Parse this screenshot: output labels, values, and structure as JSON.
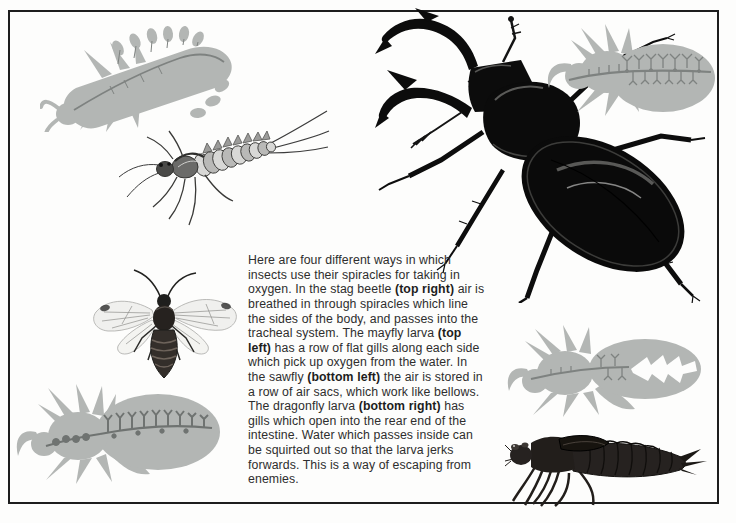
{
  "page": {
    "type": "book-illustration-page",
    "background": "#fdfdfc",
    "frame_color": "#1d1d1d"
  },
  "colors": {
    "silhouette_gray": "#b3b6b4",
    "silhouette_detail": "#7e8280",
    "air_sac_dark": "#6f7371",
    "ink_black": "#0c0c0c",
    "larva_dark_brown": "#262220",
    "text": "#2e2e2e"
  },
  "description": {
    "p1": "Here are four different ways in which insects use their spiracles for taking in oxygen. In the stag beetle ",
    "b1": "(top right)",
    "p2": " air is breathed in through spiracles which line the sides of the body, and passes into the tracheal system. The mayfly larva ",
    "b2": "(top left)",
    "p3": "  has a row of flat gills along each side which pick up oxygen from the water. In the sawfly ",
    "b3": "(bottom left)",
    "p4": " the air is stored in a row of air sacs, which work like bellows. The dragonfly larva ",
    "b4": "(bottom right)",
    "p5": " has gills which open into the rear end of the intestine. Water which passes inside can be squirted out so that the larva jerks forwards. This is a way of escaping from enemies."
  },
  "illustrations": {
    "top_left_silhouette": "mayfly-larva-gill-silhouette",
    "top_left_drawing": "mayfly-larva",
    "top_right_drawing": "stag-beetle",
    "top_right_silhouette": "stag-beetle-trachea-silhouette",
    "middle_left_drawing": "sawfly",
    "bottom_left_silhouette": "sawfly-air-sacs-silhouette",
    "bottom_right_silhouette": "dragonfly-larva-gill-silhouette",
    "bottom_right_drawing": "dragonfly-larva"
  }
}
